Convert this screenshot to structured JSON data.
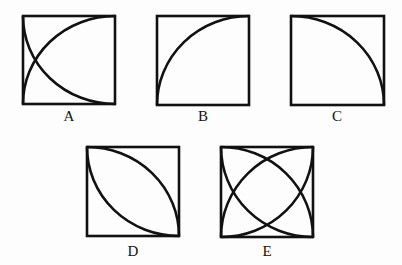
{
  "figures": [
    {
      "label": "A",
      "description": "square with two quarter-circle arcs: from bottom-left to top-right, and from top-left to bottom-right, crossing near left side"
    },
    {
      "label": "B",
      "description": "square with a quarter-circle arc from bottom-left to top-right, bulging toward upper-left"
    },
    {
      "label": "C",
      "description": "square with a quarter-circle arc from top-left to bottom-right, bulging toward upper-right"
    },
    {
      "label": "D",
      "description": "square with two arcs from top-left to bottom-right forming a lens shape"
    },
    {
      "label": "E",
      "description": "square with four quarter-circle arcs forming two overlapping lens shapes"
    }
  ],
  "colors": {
    "stroke": "#111111",
    "background": "#fdfdfd"
  }
}
